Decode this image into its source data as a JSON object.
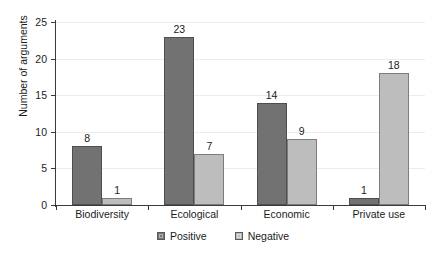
{
  "chart_data": {
    "type": "bar",
    "title": "",
    "subtitle": "",
    "xlabel": "",
    "ylabel": "Number of arguments",
    "ylim": [
      0,
      25
    ],
    "yticks": [
      0,
      5,
      10,
      15,
      20,
      25
    ],
    "ytick_labels": [
      "0",
      "5",
      "10",
      "15",
      "20",
      "25"
    ],
    "grid": true,
    "grid_axis": "y",
    "legend_position": "bottom-center",
    "categories": [
      "Biodiversity",
      "Ecological",
      "Economic",
      "Private use"
    ],
    "series": [
      {
        "name": "Positive",
        "color": "#727272",
        "values": [
          8,
          23,
          14,
          1
        ],
        "labels": [
          "8",
          "23",
          "14",
          "1"
        ]
      },
      {
        "name": "Negative",
        "color": "#bdbdbd",
        "values": [
          1,
          7,
          9,
          18
        ],
        "labels": [
          "1",
          "7",
          "9",
          "18"
        ]
      }
    ],
    "data_labels_shown": true
  },
  "legend": {
    "items": [
      {
        "label": "Positive",
        "swatch": "positive"
      },
      {
        "label": "Negative",
        "swatch": "negative"
      }
    ]
  }
}
